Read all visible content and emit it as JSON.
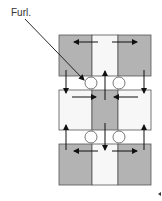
{
  "diagram": {
    "label": "Furl.",
    "colors": {
      "shaded": "#b3b3b3",
      "unshaded": "#f7f7f7",
      "stroke": "#555555",
      "arrow": "#111111",
      "circle_fill": "#ffffff"
    },
    "blocks": [
      {
        "name": "top",
        "pattern": [
          "shaded",
          "unshaded",
          "shaded"
        ]
      },
      {
        "name": "middle",
        "pattern": [
          "unshaded",
          "shaded",
          "unshaded"
        ]
      },
      {
        "name": "bottom",
        "pattern": [
          "shaded",
          "unshaded",
          "shaded"
        ]
      }
    ],
    "annotation_target": "circle-top-left"
  }
}
